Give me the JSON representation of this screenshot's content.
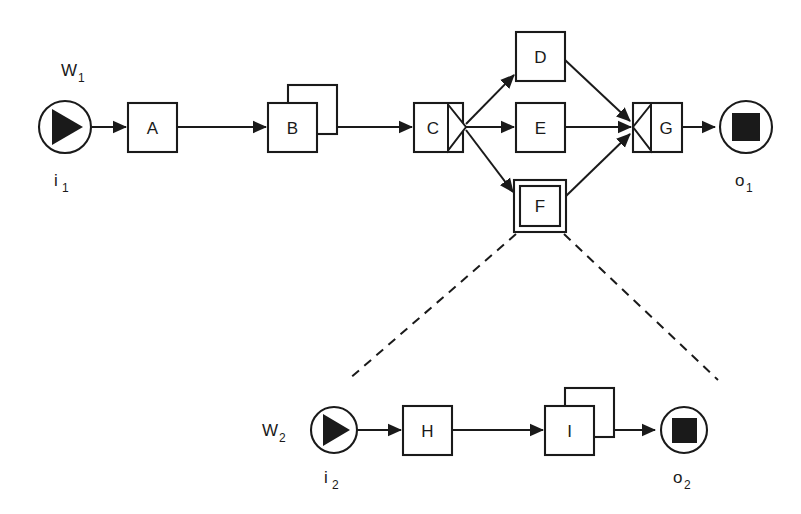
{
  "diagram": {
    "background_color": "#ffffff",
    "line_color": "#1a1a1a",
    "workflows": [
      {
        "id": "W1",
        "label": "W",
        "label_sub": "1",
        "input": {
          "id": "i1",
          "label": "i",
          "label_sub": "1",
          "icon": "start-triangle-icon"
        },
        "output": {
          "id": "o1",
          "label": "o",
          "label_sub": "1",
          "icon": "stop-square-icon"
        },
        "nodes": [
          {
            "id": "A",
            "label": "A",
            "shape": "rect"
          },
          {
            "id": "B",
            "label": "B",
            "shape": "stacked-rect"
          },
          {
            "id": "C",
            "label": "C",
            "shape": "rect-split",
            "marker": "fork-right-triangle"
          },
          {
            "id": "D",
            "label": "D",
            "shape": "rect"
          },
          {
            "id": "E",
            "label": "E",
            "shape": "rect"
          },
          {
            "id": "F",
            "label": "F",
            "shape": "double-rect",
            "expands_to": "W2"
          },
          {
            "id": "G",
            "label": "G",
            "shape": "rect-join",
            "marker": "join-left-triangle"
          }
        ],
        "edges": [
          {
            "from": "i1",
            "to": "A"
          },
          {
            "from": "A",
            "to": "B"
          },
          {
            "from": "B",
            "to": "C"
          },
          {
            "from": "C",
            "to": "D"
          },
          {
            "from": "C",
            "to": "E"
          },
          {
            "from": "C",
            "to": "F"
          },
          {
            "from": "D",
            "to": "G"
          },
          {
            "from": "E",
            "to": "G"
          },
          {
            "from": "F",
            "to": "G"
          },
          {
            "from": "G",
            "to": "o1"
          }
        ]
      },
      {
        "id": "W2",
        "label": "W",
        "label_sub": "2",
        "input": {
          "id": "i2",
          "label": "i",
          "label_sub": "2",
          "icon": "start-triangle-icon"
        },
        "output": {
          "id": "o2",
          "label": "o",
          "label_sub": "2",
          "icon": "stop-square-icon"
        },
        "nodes": [
          {
            "id": "H",
            "label": "H",
            "shape": "rect"
          },
          {
            "id": "I",
            "label": "I",
            "shape": "stacked-rect"
          }
        ],
        "edges": [
          {
            "from": "i2",
            "to": "H"
          },
          {
            "from": "H",
            "to": "I"
          },
          {
            "from": "I",
            "to": "o2"
          }
        ]
      }
    ],
    "expansion": {
      "from": "F",
      "to": "W2",
      "style": "dashed"
    }
  }
}
